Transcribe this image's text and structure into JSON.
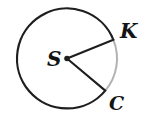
{
  "figure": {
    "type": "geometry-circle-diagram",
    "colors": {
      "background": "#ffffff",
      "stroke": "#1e1e1e",
      "minor_arc": "#b2b2b2",
      "text": "#141414"
    },
    "circle": {
      "cx": 67,
      "cy": 58.5,
      "r": 50
    },
    "center_dot": {
      "cx": 67,
      "cy": 58.5,
      "r": 2.8
    },
    "major_arc_path": "M 105.3 90.6 A 50 50 0 1 1 113.4 39.8",
    "minor_arc_path": "M 113.4 39.8 A 50 50 0 0 1 105.3 90.6",
    "radius_to_k": {
      "x1": 67,
      "y1": 58.5,
      "x2": 113.4,
      "y2": 39.8
    },
    "radius_to_c": {
      "x1": 67,
      "y1": 58.5,
      "x2": 105.3,
      "y2": 90.6
    },
    "labels": {
      "center": {
        "text": "S",
        "x": 47,
        "y": 66
      },
      "point_k": {
        "text": "K",
        "x": 120,
        "y": 38
      },
      "point_c": {
        "text": "C",
        "x": 109,
        "y": 110
      }
    }
  }
}
